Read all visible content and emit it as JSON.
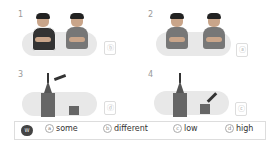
{
  "items": [
    {
      "number": "1",
      "answer": "ⓑ"
    },
    {
      "number": "2",
      "answer": "ⓐ"
    },
    {
      "number": "3",
      "answer": "ⓓ"
    },
    {
      "number": "4",
      "answer": "ⓒ"
    }
  ],
  "word_bank": {
    "icon_label": "W",
    "options": [
      {
        "letter": "a",
        "word": "some"
      },
      {
        "letter": "b",
        "word": "different"
      },
      {
        "letter": "c",
        "word": "low"
      },
      {
        "letter": "d",
        "word": "high"
      }
    ]
  }
}
